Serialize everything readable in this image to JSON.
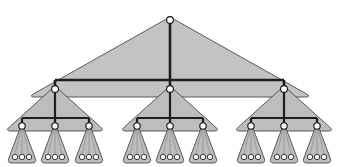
{
  "figure": {
    "title": "Recursive ternary tree diagram",
    "canvas": {
      "width": 340,
      "height": 167,
      "background": "#ffffff"
    }
  },
  "style": {
    "triangle_fill": "#c3c3c3",
    "triangle_fill_alt": "#bdbdbd",
    "triangle_stroke": "#4a4a4a",
    "edge_color": "#1e1e1e",
    "node_fill": "#ffffff",
    "node_stroke": "#111111",
    "edge_width_trunk": 2.6,
    "edge_width_branch": 2.2,
    "edge_width_twig": 1.6
  },
  "chart_data": {
    "type": "diagram",
    "subtype": "tree",
    "branching_factor": 3,
    "depth": 4,
    "level_counts": [
      1,
      3,
      9,
      27
    ],
    "total_nodes": 40,
    "levels": [
      {
        "level": 0,
        "name": "root-level",
        "node_radius": 3.4,
        "y": 20,
        "nodes": [
          {
            "id": "n0",
            "label": "",
            "x": 170,
            "y": 20
          }
        ]
      },
      {
        "level": 1,
        "name": "level-1",
        "node_radius": 3.4,
        "y": 89,
        "nodes": [
          {
            "id": "n1",
            "label": "",
            "x": 55,
            "y": 89
          },
          {
            "id": "n2",
            "label": "",
            "x": 170,
            "y": 89
          },
          {
            "id": "n3",
            "label": "",
            "x": 284,
            "y": 89
          }
        ]
      },
      {
        "level": 2,
        "name": "level-2",
        "node_radius": 3.2,
        "y": 126,
        "nodes": [
          {
            "id": "n4",
            "label": "",
            "x": 22,
            "y": 126
          },
          {
            "id": "n5",
            "label": "",
            "x": 55,
            "y": 126
          },
          {
            "id": "n6",
            "label": "",
            "x": 89,
            "y": 126
          },
          {
            "id": "n7",
            "label": "",
            "x": 137,
            "y": 126
          },
          {
            "id": "n8",
            "label": "",
            "x": 170,
            "y": 126
          },
          {
            "id": "n9",
            "label": "",
            "x": 203,
            "y": 126
          },
          {
            "id": "n10",
            "label": "",
            "x": 251,
            "y": 126
          },
          {
            "id": "n11",
            "label": "",
            "x": 284,
            "y": 126
          },
          {
            "id": "n12",
            "label": "",
            "x": 317,
            "y": 126
          }
        ]
      },
      {
        "level": 3,
        "name": "leaf-level",
        "node_radius": 2.7,
        "y": 157,
        "nodes": [
          {
            "id": "l1",
            "label": "",
            "x": 15,
            "y": 157
          },
          {
            "id": "l2",
            "label": "",
            "x": 22,
            "y": 157
          },
          {
            "id": "l3",
            "label": "",
            "x": 29,
            "y": 157
          },
          {
            "id": "l4",
            "label": "",
            "x": 48,
            "y": 157
          },
          {
            "id": "l5",
            "label": "",
            "x": 55,
            "y": 157
          },
          {
            "id": "l6",
            "label": "",
            "x": 62,
            "y": 157
          },
          {
            "id": "l7",
            "label": "",
            "x": 82,
            "y": 157
          },
          {
            "id": "l8",
            "label": "",
            "x": 89,
            "y": 157
          },
          {
            "id": "l9",
            "label": "",
            "x": 96,
            "y": 157
          },
          {
            "id": "l10",
            "label": "",
            "x": 130,
            "y": 157
          },
          {
            "id": "l11",
            "label": "",
            "x": 137,
            "y": 157
          },
          {
            "id": "l12",
            "label": "",
            "x": 144,
            "y": 157
          },
          {
            "id": "l13",
            "label": "",
            "x": 163,
            "y": 157
          },
          {
            "id": "l14",
            "label": "",
            "x": 170,
            "y": 157
          },
          {
            "id": "l15",
            "label": "",
            "x": 177,
            "y": 157
          },
          {
            "id": "l16",
            "label": "",
            "x": 196,
            "y": 157
          },
          {
            "id": "l17",
            "label": "",
            "x": 203,
            "y": 157
          },
          {
            "id": "l18",
            "label": "",
            "x": 210,
            "y": 157
          },
          {
            "id": "l19",
            "label": "",
            "x": 244,
            "y": 157
          },
          {
            "id": "l20",
            "label": "",
            "x": 251,
            "y": 157
          },
          {
            "id": "l21",
            "label": "",
            "x": 258,
            "y": 157
          },
          {
            "id": "l22",
            "label": "",
            "x": 277,
            "y": 157
          },
          {
            "id": "l23",
            "label": "",
            "x": 284,
            "y": 157
          },
          {
            "id": "l24",
            "label": "",
            "x": 291,
            "y": 157
          },
          {
            "id": "l25",
            "label": "",
            "x": 310,
            "y": 157
          },
          {
            "id": "l26",
            "label": "",
            "x": 317,
            "y": 157
          },
          {
            "id": "l27",
            "label": "",
            "x": 324,
            "y": 157
          }
        ]
      }
    ],
    "triangles": [
      {
        "id": "t-root",
        "level": 0,
        "apex_x": 170,
        "apex_y": 17,
        "base_y": 97,
        "half_width": 142,
        "corner_radius": 7
      },
      {
        "id": "t-l1-a",
        "level": 1,
        "apex_x": 55,
        "apex_y": 86,
        "base_y": 131,
        "half_width": 50,
        "corner_radius": 6
      },
      {
        "id": "t-l1-b",
        "level": 1,
        "apex_x": 170,
        "apex_y": 86,
        "base_y": 131,
        "half_width": 50,
        "corner_radius": 6
      },
      {
        "id": "t-l1-c",
        "level": 1,
        "apex_x": 284,
        "apex_y": 86,
        "base_y": 131,
        "half_width": 50,
        "corner_radius": 6
      },
      {
        "id": "t-l2-1",
        "level": 2,
        "apex_x": 22,
        "apex_y": 123,
        "base_y": 163,
        "half_width": 15,
        "corner_radius": 5
      },
      {
        "id": "t-l2-2",
        "level": 2,
        "apex_x": 55,
        "apex_y": 123,
        "base_y": 163,
        "half_width": 15,
        "corner_radius": 5
      },
      {
        "id": "t-l2-3",
        "level": 2,
        "apex_x": 89,
        "apex_y": 123,
        "base_y": 163,
        "half_width": 15,
        "corner_radius": 5
      },
      {
        "id": "t-l2-4",
        "level": 2,
        "apex_x": 137,
        "apex_y": 123,
        "base_y": 163,
        "half_width": 15,
        "corner_radius": 5
      },
      {
        "id": "t-l2-5",
        "level": 2,
        "apex_x": 170,
        "apex_y": 123,
        "base_y": 163,
        "half_width": 15,
        "corner_radius": 5
      },
      {
        "id": "t-l2-6",
        "level": 2,
        "apex_x": 203,
        "apex_y": 123,
        "base_y": 163,
        "half_width": 15,
        "corner_radius": 5
      },
      {
        "id": "t-l2-7",
        "level": 2,
        "apex_x": 251,
        "apex_y": 123,
        "base_y": 163,
        "half_width": 15,
        "corner_radius": 5
      },
      {
        "id": "t-l2-8",
        "level": 2,
        "apex_x": 284,
        "apex_y": 123,
        "base_y": 163,
        "half_width": 15,
        "corner_radius": 5
      },
      {
        "id": "t-l2-9",
        "level": 2,
        "apex_x": 317,
        "apex_y": 123,
        "base_y": 163,
        "half_width": 15,
        "corner_radius": 5
      }
    ],
    "edges": [
      {
        "id": "e-root-trunk",
        "from": "n0",
        "to": "n2",
        "kind": "vertical",
        "x": 170,
        "y1": 20,
        "y2": 89
      },
      {
        "id": "e-level1-bus",
        "kind": "horizontal",
        "y": 80,
        "x1": 55,
        "x2": 284
      },
      {
        "id": "e-n1-drop",
        "kind": "vertical",
        "x": 55,
        "y1": 80,
        "y2": 89
      },
      {
        "id": "e-n3-drop",
        "kind": "vertical",
        "x": 284,
        "y1": 80,
        "y2": 89
      },
      {
        "id": "e-n1-trunk",
        "kind": "vertical",
        "x": 55,
        "y1": 89,
        "y2": 126
      },
      {
        "id": "e-n2-trunk",
        "kind": "vertical",
        "x": 170,
        "y1": 89,
        "y2": 126
      },
      {
        "id": "e-n3-trunk",
        "kind": "vertical",
        "x": 284,
        "y1": 89,
        "y2": 126
      },
      {
        "id": "e-g1-bus",
        "kind": "horizontal",
        "y": 118,
        "x1": 22,
        "x2": 89
      },
      {
        "id": "e-g2-bus",
        "kind": "horizontal",
        "y": 118,
        "x1": 137,
        "x2": 203
      },
      {
        "id": "e-g3-bus",
        "kind": "horizontal",
        "y": 118,
        "x1": 251,
        "x2": 317
      },
      {
        "id": "e-n4-drop",
        "kind": "vertical",
        "x": 22,
        "y1": 118,
        "y2": 126
      },
      {
        "id": "e-n6-drop",
        "kind": "vertical",
        "x": 89,
        "y1": 118,
        "y2": 126
      },
      {
        "id": "e-n7-drop",
        "kind": "vertical",
        "x": 137,
        "y1": 118,
        "y2": 126
      },
      {
        "id": "e-n9-drop",
        "kind": "vertical",
        "x": 203,
        "y1": 118,
        "y2": 126
      },
      {
        "id": "e-n10-drop",
        "kind": "vertical",
        "x": 251,
        "y1": 118,
        "y2": 126
      },
      {
        "id": "e-n12-drop",
        "kind": "vertical",
        "x": 317,
        "y1": 118,
        "y2": 126
      }
    ]
  }
}
